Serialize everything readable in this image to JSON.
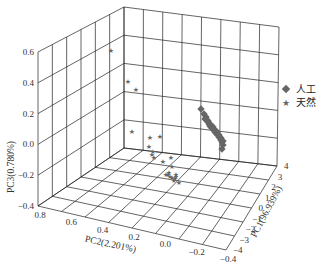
{
  "chart_data": {
    "type": "scatter",
    "subtype": "3d-scatter",
    "title": "",
    "axes": {
      "x": {
        "label": "PC2(2.201%)",
        "ticks": [
          "0.8",
          "0.6",
          "0.4",
          "0.2",
          "0.0",
          "-0.2",
          "-0.4"
        ],
        "range": [
          -0.4,
          0.8
        ]
      },
      "y": {
        "label": "PC1(96.939%)",
        "ticks": [
          "-4",
          "-3",
          "-2",
          "-1",
          "0",
          "1",
          "2",
          "3",
          "4"
        ],
        "range": [
          -4,
          4
        ]
      },
      "z": {
        "label": "PC3(0.780%)",
        "ticks": [
          "0.6",
          "0.4",
          "0.2",
          "0.0",
          "-0.2",
          "-0.4"
        ],
        "range": [
          -0.4,
          0.6
        ]
      }
    },
    "grid": true,
    "legend": {
      "position": "right",
      "entries": [
        {
          "name": "人工",
          "marker": "diamond",
          "color": "#6b6b6b"
        },
        {
          "name": "天然",
          "marker": "star",
          "color": "#6b6b6b"
        }
      ]
    },
    "series": [
      {
        "name": "人工",
        "marker": "diamond",
        "note": "tight elongated cluster on right wall",
        "points_px": [
          [
            201,
            109
          ],
          [
            204,
            114
          ],
          [
            206,
            117
          ],
          [
            207,
            120
          ],
          [
            208,
            122
          ],
          [
            209,
            124
          ],
          [
            210,
            126
          ],
          [
            211,
            127
          ],
          [
            212,
            128
          ],
          [
            213,
            129
          ],
          [
            214,
            130
          ],
          [
            215,
            132
          ],
          [
            216,
            133
          ],
          [
            217,
            134
          ],
          [
            218,
            135
          ],
          [
            219,
            137
          ],
          [
            220,
            138
          ],
          [
            221,
            140
          ],
          [
            222,
            142
          ],
          [
            223,
            145
          ],
          [
            205,
            119
          ],
          [
            208,
            121
          ],
          [
            211,
            125
          ],
          [
            213,
            127
          ],
          [
            215,
            130
          ],
          [
            217,
            132
          ],
          [
            219,
            135
          ],
          [
            221,
            138
          ],
          [
            223,
            141
          ],
          [
            222,
            149
          ]
        ]
      },
      {
        "name": "天然",
        "marker": "star",
        "note": "scattered points, mostly near floor",
        "points_px": [
          [
            111,
            50
          ],
          [
            128,
            81
          ],
          [
            136,
            89
          ],
          [
            132,
            131
          ],
          [
            150,
            137
          ],
          [
            160,
            136
          ],
          [
            149,
            146
          ],
          [
            153,
            151
          ],
          [
            152,
            154
          ],
          [
            154,
            157
          ],
          [
            171,
            157
          ],
          [
            163,
            161
          ],
          [
            172,
            166
          ],
          [
            166,
            174
          ],
          [
            168,
            174
          ],
          [
            170,
            176
          ],
          [
            172,
            177
          ],
          [
            175,
            178
          ],
          [
            176,
            174
          ],
          [
            174,
            180
          ],
          [
            169,
            172
          ],
          [
            179,
            182
          ],
          [
            176,
            176
          ]
        ]
      }
    ]
  },
  "legend": {
    "items": [
      {
        "label": "人工",
        "marker": "diamond"
      },
      {
        "label": "天然",
        "marker": "star"
      }
    ]
  },
  "colors": {
    "marker": "#666666",
    "grid": "#222222",
    "text": "#333333"
  }
}
